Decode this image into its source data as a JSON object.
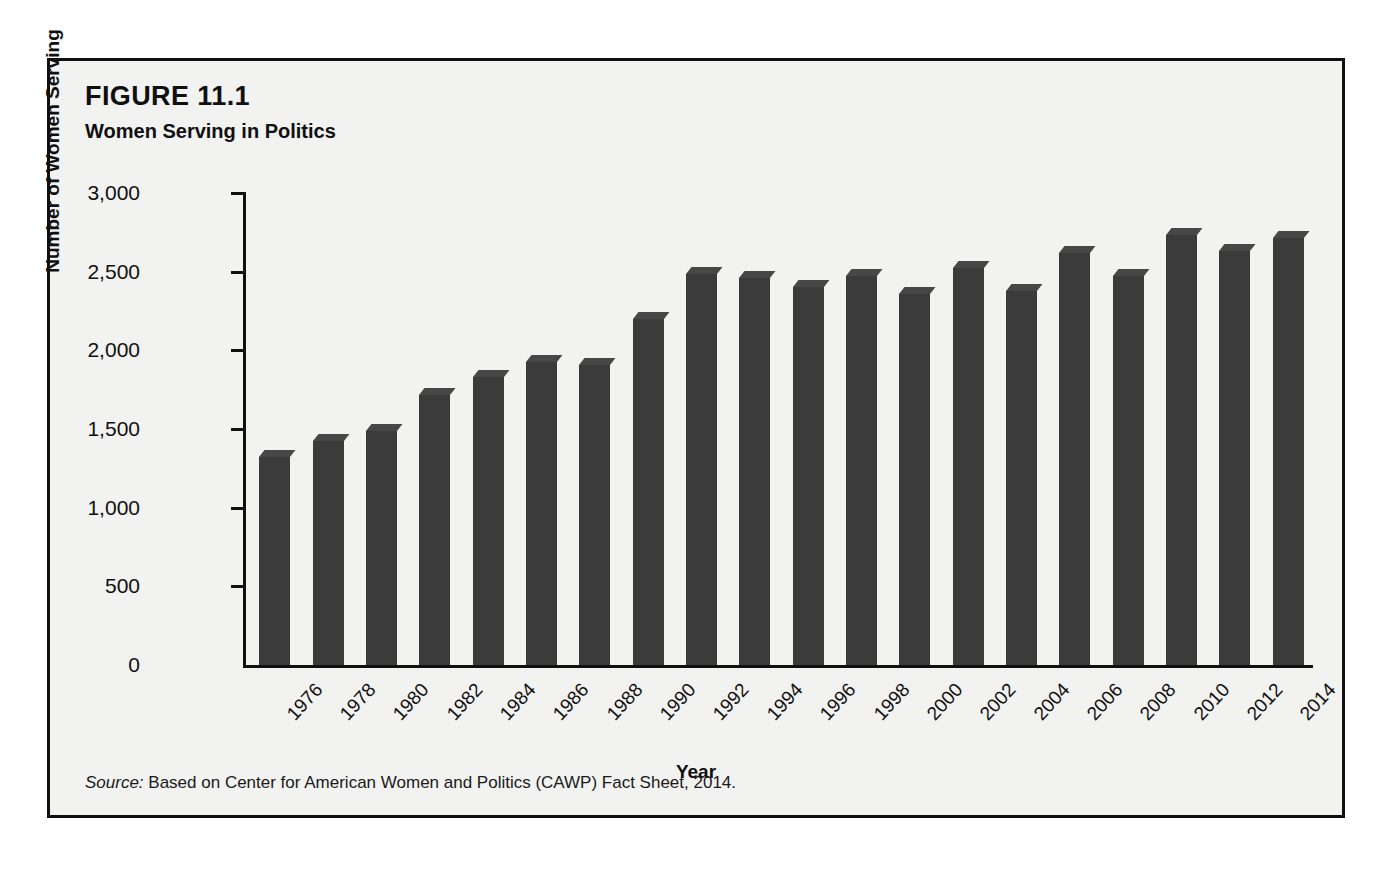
{
  "figure": {
    "number": "FIGURE 11.1",
    "title": "Women Serving in Politics",
    "source_label": "Source:",
    "source_text": " Based on Center for American Women and Politics (CAWP) Fact Sheet, 2014."
  },
  "colors": {
    "bar": "#3b3b3b",
    "bar_top": "#474747",
    "axis": "#101010",
    "panel_background": "#f2f2f0",
    "frame_border": "#101010"
  },
  "chart_data": {
    "type": "bar",
    "title": "Women Serving in Politics",
    "xlabel": "Year",
    "ylabel": "Number of Women Serving",
    "ylim": [
      0,
      3000
    ],
    "yticks": [
      0,
      500,
      1000,
      1500,
      2000,
      2500,
      3000
    ],
    "ytick_labels": [
      "0",
      "500",
      "1,000",
      "1,500",
      "2,000",
      "2,500",
      "3,000"
    ],
    "grid": false,
    "legend": false,
    "categories": [
      "1976",
      "1978",
      "1980",
      "1982",
      "1984",
      "1986",
      "1988",
      "1990",
      "1992",
      "1994",
      "1996",
      "1998",
      "2000",
      "2002",
      "2004",
      "2006",
      "2008",
      "2010",
      "2012",
      "2014"
    ],
    "values": [
      1325,
      1425,
      1490,
      1715,
      1830,
      1925,
      1910,
      2200,
      2485,
      2460,
      2405,
      2470,
      2360,
      2525,
      2380,
      2620,
      2475,
      2730,
      2630,
      2715
    ]
  }
}
